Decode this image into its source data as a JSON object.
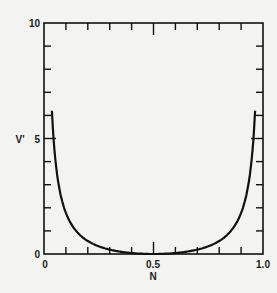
{
  "chart_data": {
    "type": "line",
    "title": "",
    "xlabel": "N",
    "ylabel": "V'",
    "xlim": [
      0,
      1.0
    ],
    "ylim": [
      0,
      10
    ],
    "x_tick_labels": [
      "0",
      "0.5",
      "1.0"
    ],
    "y_tick_labels": [
      "0",
      "5",
      "10"
    ],
    "x_minor_step": 0.1,
    "y_minor_step": 1,
    "grid": false,
    "legend": null,
    "series": [
      {
        "name": "V'(N)",
        "x": [
          0.01,
          0.02,
          0.03,
          0.05,
          0.1,
          0.15,
          0.2,
          0.25,
          0.3,
          0.35,
          0.4,
          0.45,
          0.5,
          0.55,
          0.6,
          0.65,
          0.7,
          0.75,
          0.8,
          0.85,
          0.9,
          0.95,
          0.97,
          0.98,
          0.99
        ],
        "values": [
          7.0,
          6.8,
          5.5,
          3.6,
          1.8,
          0.96,
          0.56,
          0.33,
          0.19,
          0.1,
          0.04,
          0.01,
          0.0,
          0.01,
          0.04,
          0.1,
          0.19,
          0.33,
          0.56,
          0.96,
          1.8,
          3.6,
          5.5,
          6.8,
          7.0
        ]
      }
    ],
    "color": "#111111"
  }
}
